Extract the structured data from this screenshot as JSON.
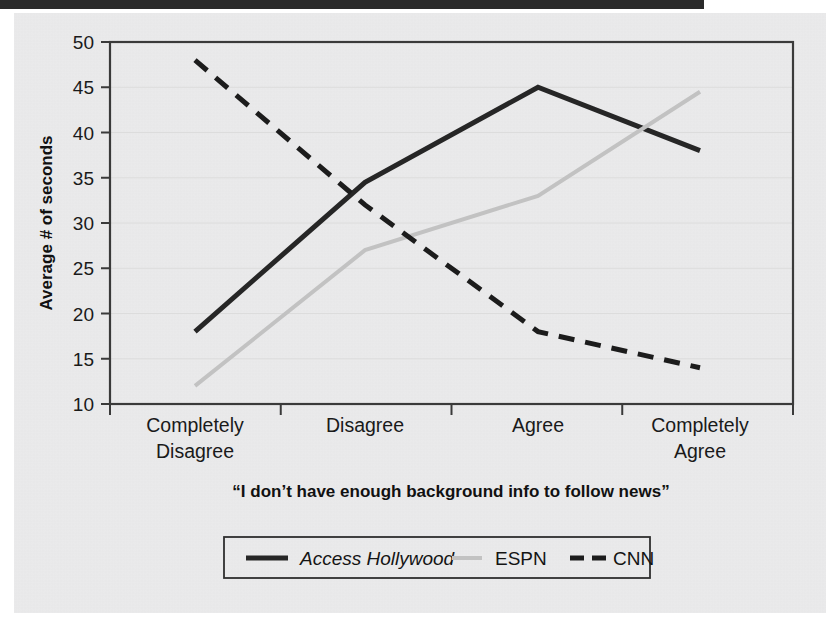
{
  "figure": {
    "background_color": "#ececed",
    "plot_border_color": "#3a3a3a",
    "gridline_color": "#dcdcdc"
  },
  "chart_data": {
    "type": "line",
    "title": "",
    "subtitle": "",
    "xlabel": "“I don’t have enough background info to follow news”",
    "ylabel": "Average # of seconds",
    "categories": [
      "Completely Disagree",
      "Disagree",
      "Agree",
      "Completely Agree"
    ],
    "category_lines": [
      [
        "Completely",
        "Disagree"
      ],
      [
        "Disagree"
      ],
      [
        "Agree"
      ],
      [
        "Completely",
        "Agree"
      ]
    ],
    "ylim": [
      10,
      50
    ],
    "yticks": [
      10,
      15,
      20,
      25,
      30,
      35,
      40,
      45,
      50
    ],
    "ytick_labels": [
      "10",
      "15",
      "20",
      "25",
      "30",
      "35",
      "40",
      "45",
      "50"
    ],
    "grid": true,
    "grid_axis": "y",
    "legend_position": "bottom",
    "series": [
      {
        "name": "Access Hollywood",
        "style": "solid",
        "color": "#262626",
        "italic_label": true,
        "width": 5,
        "values": [
          18,
          34.5,
          45,
          38
        ]
      },
      {
        "name": "ESPN",
        "style": "solid",
        "color": "#c2c2c2",
        "italic_label": false,
        "width": 4,
        "values": [
          12,
          27,
          33,
          44.5
        ]
      },
      {
        "name": "CNN",
        "style": "dashed",
        "color": "#1c1c1c",
        "italic_label": false,
        "width": 5,
        "values": [
          48,
          32,
          18,
          14
        ]
      }
    ]
  },
  "legend": {
    "items": [
      {
        "label": "Access Hollywood",
        "style": "solid",
        "color": "#262626",
        "italic": true
      },
      {
        "label": "ESPN",
        "style": "solid",
        "color": "#c2c2c2",
        "italic": false
      },
      {
        "label": "CNN",
        "style": "dashed",
        "color": "#1c1c1c",
        "italic": false
      }
    ]
  }
}
